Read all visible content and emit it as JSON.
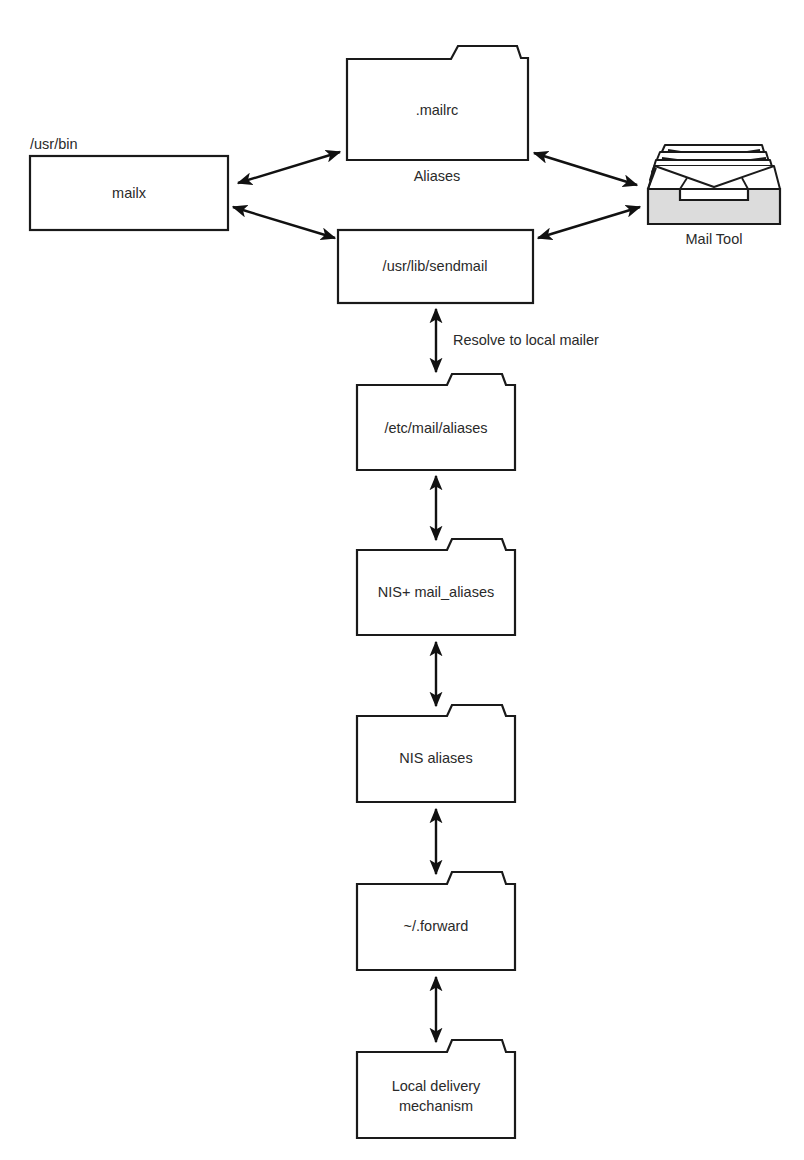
{
  "diagram": {
    "type": "mail-alias-resolution-flow",
    "nodes": {
      "mailx": {
        "label": "mailx",
        "location_label": "/usr/bin",
        "shape": "box"
      },
      "mailrc": {
        "label": ".mailrc",
        "caption": "Aliases",
        "shape": "folder"
      },
      "mailtool": {
        "label": "Mail Tool",
        "shape": "mail-tray-icon"
      },
      "sendmail": {
        "label": "/usr/lib/sendmail",
        "shape": "box"
      },
      "etc_aliases": {
        "label": "/etc/mail/aliases",
        "shape": "folder"
      },
      "nisplus": {
        "label": "NIS+ mail_aliases",
        "shape": "folder"
      },
      "nis": {
        "label": "NIS aliases",
        "shape": "folder"
      },
      "forward": {
        "label": "~/.forward",
        "shape": "folder"
      },
      "local": {
        "label_line1": "Local delivery",
        "label_line2": "mechanism",
        "shape": "folder"
      }
    },
    "edges": [
      {
        "from": "mailx",
        "to": "mailrc",
        "bidirectional": true
      },
      {
        "from": "mailx",
        "to": "sendmail",
        "bidirectional": true
      },
      {
        "from": "mailrc",
        "to": "mailtool",
        "bidirectional": true
      },
      {
        "from": "sendmail",
        "to": "mailtool",
        "bidirectional": true
      },
      {
        "from": "sendmail",
        "to": "etc_aliases",
        "bidirectional": true,
        "label": "Resolve to local mailer"
      },
      {
        "from": "etc_aliases",
        "to": "nisplus",
        "bidirectional": true
      },
      {
        "from": "nisplus",
        "to": "nis",
        "bidirectional": true
      },
      {
        "from": "nis",
        "to": "forward",
        "bidirectional": true
      },
      {
        "from": "forward",
        "to": "local",
        "bidirectional": true
      }
    ],
    "edge_labels": {
      "resolve": "Resolve to local mailer"
    },
    "colors": {
      "stroke": "#1a1a1a",
      "text": "#2a2a2a",
      "tray_fill": "#dcdcdc",
      "background": "#ffffff"
    }
  }
}
